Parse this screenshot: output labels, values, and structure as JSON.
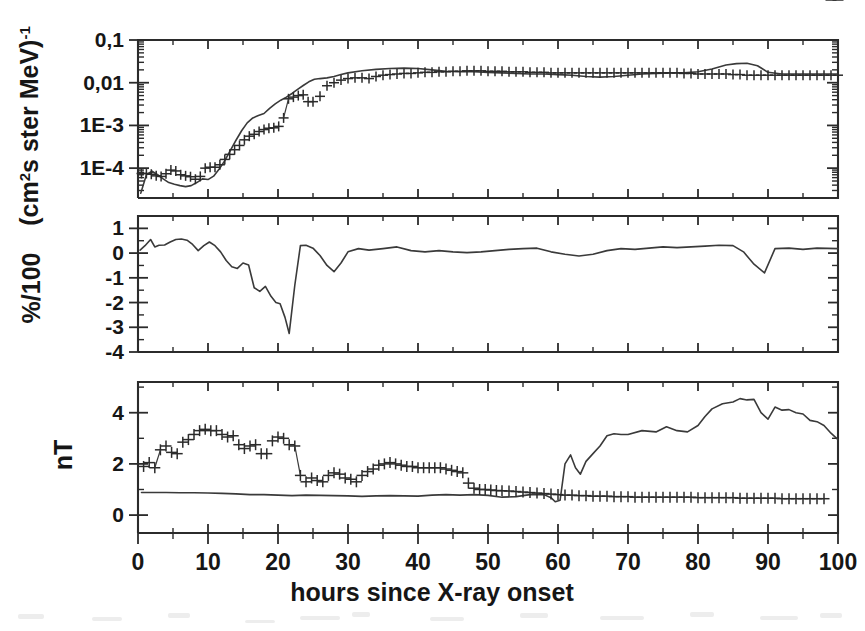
{
  "figure": {
    "background_color": "#ffffff",
    "ink_color": "#2b2b2b",
    "line_color": "#3a3a3a"
  },
  "xaxis": {
    "label": "hours since X-ray onset",
    "ticks": [
      "0",
      "10",
      "20",
      "30",
      "40",
      "50",
      "60",
      "70",
      "80",
      "90",
      "100"
    ],
    "min": 0,
    "max": 100,
    "minor_per_major": 2
  },
  "panels": {
    "top": {
      "ylabel": "(cm²s ster MeV)⁻¹",
      "ylabel_parts": {
        "open": "(cm",
        "sup1": "2",
        "mid": "s ster MeV)",
        "sup2": "-1"
      },
      "ticks": [
        "0,1",
        "0,01",
        "1E-3",
        "1E-4"
      ],
      "scale": "log"
    },
    "middle": {
      "ylabel": "%/100",
      "ticks": [
        "1",
        "0",
        "-1",
        "-2",
        "-3",
        "-4"
      ],
      "scale": "linear"
    },
    "bottom": {
      "ylabel": "nT",
      "ticks": [
        "4",
        "2",
        "0"
      ],
      "scale": "linear"
    }
  },
  "chart_data": [
    {
      "type": "line",
      "panel": "top",
      "title": "",
      "xlabel": "hours since X-ray onset",
      "ylabel": "(cm2s ster MeV)-1",
      "yscale": "log",
      "ylim": [
        2e-05,
        0.1
      ],
      "xlim": [
        0,
        100
      ],
      "grid": false,
      "legend": "none",
      "series": [
        {
          "name": "proton flux model",
          "style": "line",
          "x": [
            0.4,
            1.2,
            2.0,
            2.8,
            3.6,
            4.4,
            5.2,
            6.0,
            6.8,
            7.6,
            8.4,
            9.2,
            10.0,
            10.8,
            11.6,
            12.4,
            13.2,
            14.0,
            14.8,
            15.6,
            16.4,
            17.2,
            18.0,
            18.8,
            19.6,
            20.4,
            21.2,
            22.0,
            22.8,
            23.6,
            24.4,
            25.2,
            26.0,
            27.0,
            28.0,
            29.0,
            30.0,
            32.0,
            34.0,
            36.0,
            38.0,
            40.0,
            42.0,
            44.0,
            46.0,
            48.0,
            50.0,
            52.0,
            54.0,
            56.0,
            58.0,
            60.0,
            62.0,
            64.0,
            66.0,
            68.0,
            70.0,
            72.0,
            74.0,
            76.0,
            78.0,
            80.0,
            82.0,
            84.0,
            85.5,
            87.0,
            88.5,
            90.0,
            92.0,
            94.0,
            96.0,
            98.0,
            100.0
          ],
          "y": [
            2.6e-05,
            7e-05,
            8.5e-05,
            7e-05,
            5.6e-05,
            4.6e-05,
            4.2e-05,
            3.9e-05,
            3.7e-05,
            3.9e-05,
            4.6e-05,
            5.6e-05,
            5.4e-05,
            6.5e-05,
            9.5e-05,
            0.00015,
            0.00026,
            0.00045,
            0.00075,
            0.00115,
            0.0015,
            0.0017,
            0.0019,
            0.0025,
            0.0032,
            0.0039,
            0.0046,
            0.0056,
            0.007,
            0.0086,
            0.0105,
            0.012,
            0.0125,
            0.013,
            0.014,
            0.0155,
            0.017,
            0.019,
            0.0205,
            0.0215,
            0.022,
            0.0215,
            0.02,
            0.0185,
            0.018,
            0.018,
            0.0175,
            0.017,
            0.0165,
            0.016,
            0.016,
            0.0155,
            0.015,
            0.014,
            0.0135,
            0.014,
            0.015,
            0.016,
            0.0165,
            0.017,
            0.017,
            0.018,
            0.021,
            0.026,
            0.028,
            0.0285,
            0.025,
            0.0175,
            0.016,
            0.016,
            0.016,
            0.016,
            0.016
          ]
        },
        {
          "name": "proton flux observed",
          "style": "plus-markers",
          "x": [
            0.5,
            1.2,
            1.9,
            2.6,
            3.3,
            4.0,
            4.7,
            5.4,
            6.1,
            6.8,
            7.5,
            8.2,
            8.9,
            9.6,
            10.3,
            11.0,
            11.7,
            12.4,
            13.1,
            13.8,
            14.5,
            15.2,
            15.9,
            16.6,
            17.3,
            18.0,
            18.7,
            19.4,
            20.1,
            20.8,
            21.5,
            22.2,
            22.9,
            23.6,
            24.3,
            25.0,
            26.0,
            27.0,
            28.0,
            29.0,
            30.0,
            31.0,
            32.0,
            33.0,
            34.0,
            35.0,
            36.0,
            37.0,
            38.0,
            39.0,
            40.0,
            41.0,
            42.0,
            43.0,
            44.0,
            45.0,
            46.0,
            47.0,
            48.0,
            49.0,
            50.0,
            51.0,
            52.0,
            53.0,
            54.0,
            55.0,
            56.0,
            57.0,
            58.0,
            59.0,
            60.0,
            61.0,
            62.0,
            63.0,
            64.0,
            65.0,
            66.0,
            67.0,
            68.0,
            69.0,
            70.0,
            71.0,
            72.0,
            73.0,
            74.0,
            75.0,
            76.0,
            77.0,
            78.0,
            79.0,
            80.0,
            81.0,
            82.0,
            83.0,
            84.0,
            85.0,
            86.0,
            87.0,
            88.0,
            89.0,
            90.0,
            91.0,
            92.0,
            93.0,
            94.0,
            95.0,
            96.0,
            97.0,
            98.0,
            99.0,
            100.0
          ],
          "y": [
            7.5e-05,
            7.5e-05,
            7.2e-05,
            6.6e-05,
            6.4e-05,
            7.4e-05,
            9e-05,
            8.6e-05,
            7e-05,
            6.6e-05,
            6.3e-05,
            5.5e-05,
            6.4e-05,
            0.0001,
            0.000105,
            0.000105,
            0.00012,
            0.00016,
            0.00021,
            0.00027,
            0.00034,
            0.00046,
            0.00056,
            0.00062,
            0.00072,
            0.0008,
            0.00086,
            0.00088,
            0.00095,
            0.0015,
            0.0042,
            0.0046,
            0.005,
            0.0052,
            0.0036,
            0.0036,
            0.0048,
            0.0085,
            0.01,
            0.0115,
            0.0125,
            0.013,
            0.013,
            0.0125,
            0.014,
            0.015,
            0.0155,
            0.016,
            0.0165,
            0.0165,
            0.017,
            0.0175,
            0.0175,
            0.018,
            0.018,
            0.0185,
            0.0185,
            0.019,
            0.019,
            0.019,
            0.0185,
            0.0185,
            0.0185,
            0.018,
            0.018,
            0.018,
            0.0175,
            0.0175,
            0.0175,
            0.017,
            0.017,
            0.017,
            0.017,
            0.017,
            0.017,
            0.017,
            0.017,
            0.017,
            0.017,
            0.017,
            0.017,
            0.017,
            0.017,
            0.017,
            0.017,
            0.017,
            0.017,
            0.017,
            0.0165,
            0.0165,
            0.016,
            0.016,
            0.016,
            0.016,
            0.016,
            0.0155,
            0.0155,
            0.015,
            0.015,
            0.015,
            0.015,
            0.015,
            0.015,
            0.015,
            0.015,
            0.015,
            0.015,
            0.015,
            0.015,
            0.015,
            0.015
          ]
        }
      ]
    },
    {
      "type": "line",
      "panel": "middle",
      "title": "",
      "xlabel": "hours since X-ray onset",
      "ylabel": "%/100",
      "yscale": "linear",
      "ylim": [
        -4,
        1.5
      ],
      "xlim": [
        0,
        100
      ],
      "grid": false,
      "legend": "none",
      "series": [
        {
          "name": "cosmic ray intensity",
          "style": "line",
          "x": [
            0.3,
            1.0,
            1.8,
            2.4,
            3.0,
            3.8,
            4.6,
            5.4,
            6.2,
            7.0,
            7.8,
            8.6,
            9.4,
            10.2,
            11.0,
            11.8,
            12.6,
            13.4,
            14.2,
            15.0,
            15.8,
            16.6,
            17.4,
            18.2,
            19.0,
            19.7,
            20.3,
            21.0,
            21.6,
            22.4,
            23.2,
            24.0,
            25.0,
            26.0,
            27.0,
            28.0,
            29.0,
            30.0,
            31.5,
            33.0,
            35.0,
            37.0,
            39.0,
            41.0,
            43.0,
            45.0,
            47.0,
            49.0,
            51.0,
            53.0,
            55.0,
            57.0,
            59.0,
            61.0,
            63.0,
            65.0,
            67.0,
            69.0,
            71.0,
            73.0,
            75.0,
            77.0,
            79.0,
            81.0,
            83.0,
            85.0,
            86.5,
            88.0,
            89.5,
            91.0,
            93.0,
            95.0,
            97.0,
            100.0
          ],
          "y": [
            0.12,
            0.3,
            0.55,
            0.25,
            0.32,
            0.33,
            0.45,
            0.55,
            0.57,
            0.52,
            0.35,
            0.1,
            0.3,
            0.45,
            0.3,
            0.05,
            -0.3,
            -0.55,
            -0.62,
            -0.4,
            -0.48,
            -1.4,
            -1.55,
            -1.35,
            -1.75,
            -2.0,
            -2.05,
            -2.6,
            -3.25,
            -1.3,
            0.3,
            0.32,
            0.2,
            -0.1,
            -0.5,
            -0.75,
            -0.4,
            0.05,
            0.18,
            0.12,
            0.18,
            0.25,
            0.1,
            0.05,
            0.1,
            0.05,
            0.02,
            0.05,
            0.1,
            0.15,
            0.18,
            0.2,
            0.05,
            -0.05,
            -0.12,
            -0.05,
            0.1,
            0.18,
            0.15,
            0.2,
            0.25,
            0.22,
            0.25,
            0.28,
            0.32,
            0.3,
            0.05,
            -0.45,
            -0.8,
            0.18,
            0.2,
            0.15,
            0.2,
            0.18
          ]
        }
      ]
    },
    {
      "type": "line",
      "panel": "bottom",
      "title": "",
      "xlabel": "hours since X-ray onset",
      "ylabel": "nT",
      "yscale": "linear",
      "ylim": [
        -0.7,
        5.2
      ],
      "xlim": [
        0,
        100
      ],
      "grid": false,
      "legend": "none",
      "series": [
        {
          "name": "magnetic field model",
          "style": "line",
          "x": [
            0.5,
            2.0,
            4.0,
            6.0,
            8.0,
            10.0,
            12.0,
            14.0,
            16.0,
            18.0,
            20.0,
            22.0,
            24.0,
            26.0,
            28.0,
            30.0,
            32.0,
            34.0,
            36.0,
            38.0,
            40.0,
            42.0,
            44.0,
            46.0,
            48.0,
            50.0,
            52.0,
            54.0,
            56.0,
            58.0,
            59.0,
            59.6,
            60.3,
            61.0,
            61.8,
            62.5,
            63.2,
            64.0,
            65.0,
            66.0,
            67.0,
            68.0,
            69.0,
            70.0,
            72.0,
            74.0,
            75.5,
            77.0,
            78.5,
            80.0,
            81.0,
            82.0,
            83.5,
            85.0,
            86.0,
            87.0,
            88.0,
            89.0,
            90.0,
            91.0,
            92.0,
            93.0,
            94.0,
            95.0,
            96.0,
            97.0,
            98.0,
            99.0,
            100.0
          ],
          "y": [
            0.88,
            0.88,
            0.88,
            0.87,
            0.87,
            0.86,
            0.85,
            0.83,
            0.8,
            0.8,
            0.78,
            0.76,
            0.78,
            0.77,
            0.76,
            0.75,
            0.73,
            0.75,
            0.76,
            0.75,
            0.74,
            0.78,
            0.8,
            0.78,
            0.8,
            0.77,
            0.7,
            0.72,
            0.8,
            0.8,
            0.68,
            0.52,
            0.58,
            2.0,
            2.35,
            1.85,
            1.6,
            2.1,
            2.4,
            2.7,
            3.1,
            3.18,
            3.15,
            3.15,
            3.3,
            3.25,
            3.45,
            3.3,
            3.25,
            3.5,
            3.85,
            4.15,
            4.35,
            4.42,
            4.55,
            4.5,
            4.52,
            4.0,
            3.75,
            4.22,
            4.1,
            4.12,
            4.0,
            3.95,
            3.7,
            3.65,
            3.5,
            3.2,
            2.95
          ]
        },
        {
          "name": "magnetic field observed",
          "style": "plus-markers",
          "x": [
            0.8,
            1.6,
            2.4,
            3.2,
            4.0,
            4.8,
            5.6,
            6.4,
            7.2,
            8.0,
            8.8,
            9.6,
            10.4,
            11.2,
            12.0,
            12.8,
            13.6,
            14.4,
            15.2,
            16.0,
            16.8,
            17.6,
            18.4,
            19.2,
            20.0,
            20.8,
            21.6,
            22.4,
            23.2,
            24.0,
            24.8,
            25.6,
            26.4,
            27.2,
            28.0,
            28.8,
            29.6,
            30.4,
            31.2,
            32.0,
            32.8,
            33.6,
            34.4,
            35.2,
            36.0,
            36.8,
            37.6,
            38.4,
            39.2,
            40.0,
            40.8,
            41.6,
            42.4,
            43.2,
            44.0,
            44.8,
            45.6,
            46.4,
            47.2,
            48.0,
            48.8,
            49.6,
            50.4,
            51.2,
            52.0,
            53.0,
            54.0,
            55.0,
            56.0,
            57.0,
            58.0,
            59.0,
            60.0,
            61.0,
            62.0,
            63.0,
            64.0,
            65.0,
            66.0,
            67.0,
            68.0,
            69.0,
            70.0,
            71.0,
            72.0,
            73.0,
            74.0,
            75.0,
            76.0,
            77.0,
            78.0,
            79.0,
            80.0,
            81.0,
            82.0,
            83.0,
            84.0,
            85.0,
            86.0,
            87.0,
            88.0,
            89.0,
            90.0,
            91.0,
            92.0,
            93.0,
            94.0,
            95.0,
            96.0,
            97.0,
            98.0,
            99.0,
            100.0
          ],
          "y": [
            1.9,
            2.05,
            1.85,
            2.55,
            2.7,
            2.45,
            2.4,
            2.85,
            2.95,
            3.15,
            3.3,
            3.35,
            3.3,
            3.3,
            3.15,
            3.05,
            3.1,
            2.75,
            2.6,
            2.7,
            2.75,
            2.4,
            2.4,
            2.9,
            3.05,
            3.0,
            2.75,
            2.7,
            1.55,
            1.3,
            1.45,
            1.35,
            1.3,
            1.55,
            1.65,
            1.6,
            1.45,
            1.4,
            1.3,
            1.55,
            1.7,
            1.8,
            1.95,
            2.0,
            2.05,
            2.0,
            1.95,
            1.9,
            1.9,
            1.85,
            1.85,
            1.85,
            1.85,
            1.85,
            1.8,
            1.75,
            1.7,
            1.65,
            1.25,
            1.05,
            1.0,
            1.0,
            0.98,
            0.96,
            0.95,
            0.94,
            0.92,
            0.9,
            0.88,
            0.86,
            0.84,
            0.82,
            0.8,
            0.78,
            0.78,
            0.76,
            0.76,
            0.74,
            0.74,
            0.74,
            0.72,
            0.72,
            0.72,
            0.7,
            0.7,
            0.7,
            0.7,
            0.7,
            0.7,
            0.7,
            0.7,
            0.7,
            0.68,
            0.68,
            0.68,
            0.68,
            0.68,
            0.68,
            0.66,
            0.66,
            0.66,
            0.66,
            0.66,
            0.66,
            0.64,
            0.64,
            0.64,
            0.64,
            0.64,
            0.64,
            0.64
          ]
        }
      ]
    }
  ]
}
